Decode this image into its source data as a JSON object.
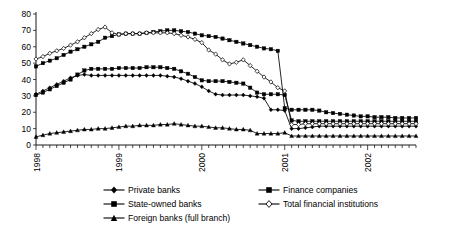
{
  "chart_data": {
    "type": "line",
    "title": "",
    "subtitle": "",
    "xlabel": "",
    "ylabel": "",
    "ylim": [
      0,
      80
    ],
    "yticks": [
      0,
      10,
      20,
      30,
      40,
      50,
      60,
      70,
      80
    ],
    "xlim": [
      "1998-01",
      "2002-09"
    ],
    "xticks": [
      "1998",
      "1999",
      "2000",
      "2001",
      "2002"
    ],
    "xtick_positions": [
      0,
      12,
      24,
      36,
      48
    ],
    "grid": false,
    "legend_position": "bottom",
    "x": [
      "1998-01",
      "1998-02",
      "1998-03",
      "1998-04",
      "1998-05",
      "1998-06",
      "1998-07",
      "1998-08",
      "1998-09",
      "1998-10",
      "1998-11",
      "1998-12",
      "1999-01",
      "1999-02",
      "1999-03",
      "1999-04",
      "1999-05",
      "1999-06",
      "1999-07",
      "1999-08",
      "1999-09",
      "1999-10",
      "1999-11",
      "1999-12",
      "2000-01",
      "2000-02",
      "2000-03",
      "2000-04",
      "2000-05",
      "2000-06",
      "2000-07",
      "2000-08",
      "2000-09",
      "2000-10",
      "2000-11",
      "2000-12",
      "2001-01",
      "2001-02",
      "2001-03",
      "2001-04",
      "2001-05",
      "2001-06",
      "2001-07",
      "2001-08",
      "2001-09",
      "2001-10",
      "2001-11",
      "2001-12",
      "2002-01",
      "2002-02",
      "2002-03",
      "2002-04",
      "2002-05",
      "2002-06",
      "2002-07",
      "2002-08"
    ],
    "series": [
      {
        "name": "Private banks",
        "marker": "diamond-filled",
        "values": [
          31,
          33,
          35,
          37,
          39,
          41,
          42.5,
          43,
          42.5,
          42.5,
          42.5,
          42.5,
          42.5,
          42.5,
          42.5,
          42.5,
          42.5,
          42.5,
          42.5,
          42,
          41.5,
          40.5,
          39,
          37.5,
          35.5,
          33,
          31,
          30.5,
          30.5,
          30.5,
          30.5,
          30,
          29.5,
          28.5,
          21.5,
          21.5,
          21,
          10,
          10,
          10.5,
          11,
          11.5,
          11.5,
          11.5,
          11.5,
          11.5,
          11.5,
          11.5,
          11.5,
          11.5,
          11.5,
          11.5,
          11.5,
          11.5,
          11.5,
          11.5
        ]
      },
      {
        "name": "State-owned banks",
        "marker": "square-filled",
        "values": [
          30.5,
          32,
          34,
          36,
          38,
          40,
          43,
          45.5,
          46.5,
          46.5,
          46.5,
          46.5,
          47,
          47,
          47,
          47,
          47.5,
          47.5,
          47.5,
          47,
          46.5,
          45,
          43.5,
          41.5,
          39.5,
          39,
          39,
          39,
          38.5,
          38,
          37.5,
          35,
          32,
          31,
          31,
          31,
          30.5,
          15,
          14.5,
          14.5,
          14.5,
          14.5,
          14.5,
          14.5,
          14.5,
          14.5,
          14.5,
          14.5,
          14.5,
          14.5,
          14.5,
          14.5,
          14.5,
          14.5,
          14.5,
          14.5
        ]
      },
      {
        "name": "Foreign banks (full branch)",
        "marker": "triangle-filled",
        "values": [
          5,
          6,
          7,
          7.5,
          8,
          8.5,
          9,
          9.5,
          9.5,
          10,
          10,
          10.5,
          11,
          11.5,
          11.5,
          12,
          12,
          12,
          12.5,
          12.5,
          13,
          12.5,
          12,
          11.5,
          11.5,
          11,
          10.5,
          10.5,
          10,
          9.5,
          9.5,
          9,
          7,
          7,
          7,
          7,
          7.5,
          5.5,
          5.5,
          5.5,
          5.5,
          5.5,
          5.5,
          5.5,
          5.5,
          5.5,
          5.5,
          5.5,
          5.5,
          5.5,
          5.5,
          5.5,
          5.5,
          5.5,
          5.5,
          5.5
        ]
      },
      {
        "name": "Finance companies",
        "marker": "square-filled",
        "values": [
          48,
          50,
          51.5,
          53,
          55,
          57,
          58.5,
          60,
          61.5,
          63,
          65.5,
          66.5,
          67.5,
          68,
          68,
          68,
          68.5,
          69,
          69.5,
          70,
          70,
          69.5,
          69,
          68,
          67,
          66.5,
          66,
          65,
          64,
          63,
          62,
          61,
          60,
          59,
          58.5,
          57.5,
          22.5,
          21.5,
          21.5,
          21.5,
          21.5,
          21,
          20,
          19.5,
          19,
          18.5,
          18,
          17.5,
          17.5,
          17,
          17,
          17,
          16.5,
          16.5,
          16.5,
          16.5
        ]
      },
      {
        "name": "Total financial institutions",
        "marker": "diamond-open",
        "values": [
          52.5,
          54,
          56,
          57.5,
          59,
          61,
          63,
          65.5,
          68,
          70.5,
          72,
          68.5,
          67.5,
          68,
          68,
          68,
          68.5,
          68.5,
          68.5,
          68.5,
          68,
          67,
          66,
          64.5,
          62.5,
          58,
          55.5,
          52,
          49.5,
          50.5,
          52,
          48.5,
          45,
          41.5,
          38.5,
          35,
          33,
          12.5,
          12.5,
          13,
          13,
          13,
          13,
          13,
          13,
          13,
          13,
          13,
          13,
          13,
          13,
          13,
          13,
          13,
          13,
          13
        ]
      }
    ]
  },
  "legend": {
    "entries_left": [
      {
        "label": "Private banks",
        "marker": "diamond-filled"
      },
      {
        "label": "State-owned banks",
        "marker": "square-filled"
      },
      {
        "label": "Foreign banks (full branch)",
        "marker": "triangle-filled"
      }
    ],
    "entries_right": [
      {
        "label": "Finance companies",
        "marker": "square-filled"
      },
      {
        "label": "Total financial institutions",
        "marker": "diamond-open"
      }
    ]
  },
  "colors": {
    "line": "#000000",
    "axis": "#000000",
    "background": "#ffffff"
  }
}
